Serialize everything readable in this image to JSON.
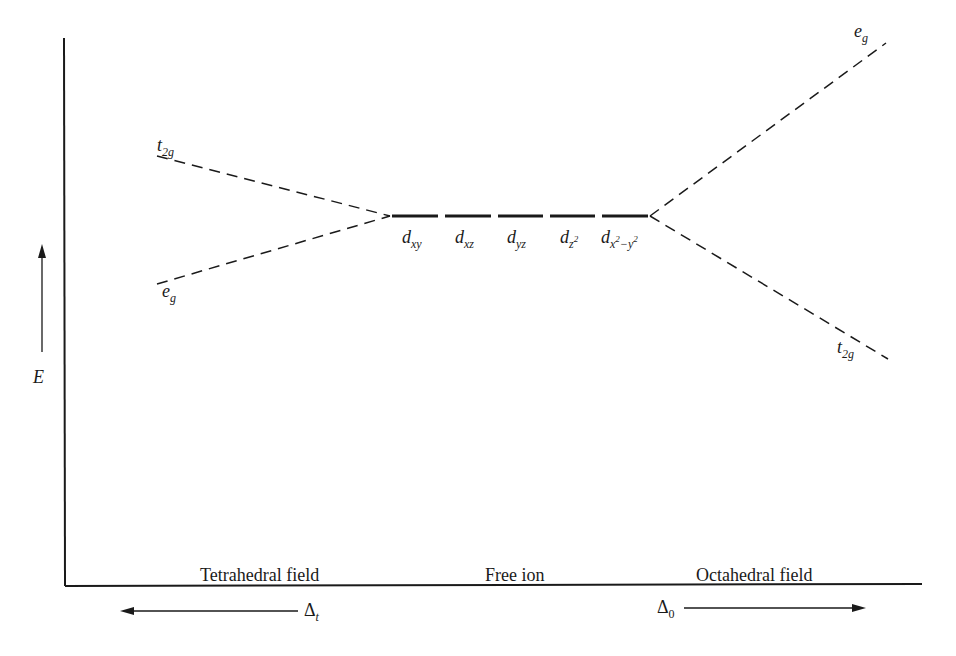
{
  "diagram": {
    "type": "crystal-field-splitting",
    "axis": {
      "y_label": "E",
      "x_sections": [
        "Tetrahedral field",
        "Free ion",
        "Octahedral field"
      ]
    },
    "free_ion": {
      "orbitals": [
        {
          "base": "d",
          "sub": "xy"
        },
        {
          "base": "d",
          "sub": "xz"
        },
        {
          "base": "d",
          "sub": "yz"
        },
        {
          "base": "d",
          "sub": "z",
          "sup_in_sub": "2"
        },
        {
          "base": "d",
          "sub": "x",
          "sub_sup1": "2",
          "sub_mid": "−y",
          "sub_sup2": "2"
        }
      ]
    },
    "tetrahedral": {
      "upper": {
        "base": "t",
        "sub": "2g"
      },
      "lower": {
        "base": "e",
        "sub": "g"
      },
      "delta": {
        "symbol": "Δ",
        "sub": "t"
      }
    },
    "octahedral": {
      "upper": {
        "base": "e",
        "sub": "g"
      },
      "lower": {
        "base": "t",
        "sub": "2g"
      },
      "delta": {
        "symbol": "Δ",
        "sub": "0"
      }
    }
  }
}
